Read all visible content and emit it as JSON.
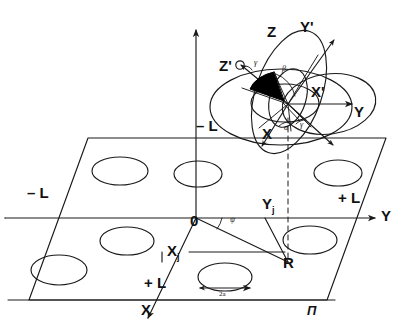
{
  "figure": {
    "kind": "technical-line-diagram",
    "stroke_color": "#1a1a1a",
    "fill_color": "#000000",
    "background": "#ffffff"
  },
  "axes": {
    "z_label": "Z",
    "y_label": "Y",
    "x_label": "X",
    "z_prime_label": "Z'",
    "y_prime_label": "Y'",
    "x_prime_label": "X'",
    "x_body_label": "X",
    "origin_label": "0"
  },
  "angles": {
    "alpha": "α",
    "beta": "β",
    "gamma_top": "γ",
    "gamma_low": "γ",
    "psi": "ψ"
  },
  "plane": {
    "plane_label": "П",
    "bound_minus_z": "– L",
    "bound_minus_y": "– L",
    "bound_plus_y": "+ L",
    "bound_plus_x": "+ L"
  },
  "markers": {
    "x_j": "X",
    "x_j_sub": "j",
    "y_j": "Y",
    "y_j_sub": "j",
    "radius_label": "R",
    "diameter_label": "2a"
  }
}
